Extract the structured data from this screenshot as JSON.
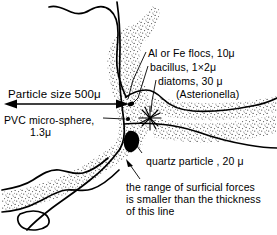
{
  "figure": {
    "labels": {
      "particle_size": "Particle size 500μ",
      "pvc_sphere": "PVC micro-sphere,",
      "pvc_sphere_size": "1.3μ",
      "al_fe_flocs": "Al or Fe flocs, 10μ",
      "bacillus": "bacillus, 1×2μ",
      "diatoms": "diatoms, 30 μ",
      "asterionella": "(Asterionella)",
      "quartz": "quartz particle , 20 μ",
      "surficial_forces": "the range of surficial forces\nis smaller than the thickness\nof this line"
    },
    "icons": {
      "bacillus": "bacillus-oval-icon",
      "pvc_sphere": "pvc-microsphere-dot-icon",
      "diatom": "diatom-star-icon",
      "quartz": "quartz-blob-icon",
      "size_arrow": "double-headed-arrow-icon",
      "leader_lines": "leader-line-icon",
      "stipple_band": "stippled-surface-band-icon"
    },
    "colors": {
      "ink": "#000000",
      "background": "#ffffff",
      "stipple": "#4a4a4a"
    }
  }
}
